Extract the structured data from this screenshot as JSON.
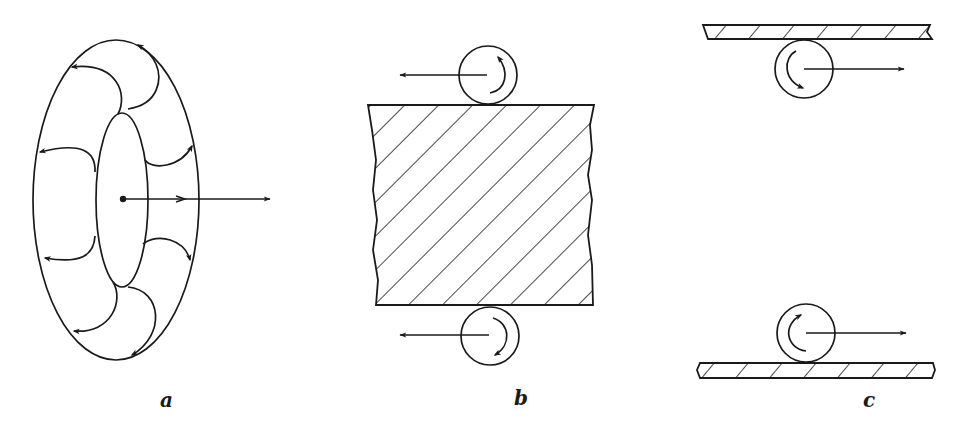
{
  "figure": {
    "panels": [
      {
        "id": "a",
        "label": "a",
        "description": "Vortex ring (torus) with circulation lines and translation velocity arrow"
      },
      {
        "id": "b",
        "label": "b",
        "description": "Rollers above and below a hatched block, both translating left with opposite rotation"
      },
      {
        "id": "c",
        "label": "c",
        "description": "Rollers against plates above and below, both translating right with opposite rotation"
      }
    ]
  },
  "colors": {
    "ink": "#1a1a1a",
    "background": "#ffffff"
  }
}
